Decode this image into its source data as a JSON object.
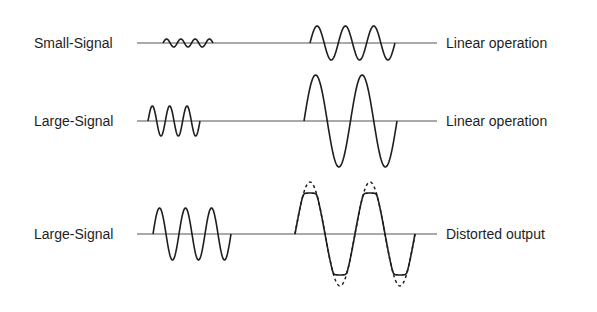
{
  "rows": [
    {
      "left_label": "Small-Signal",
      "right_label": "Linear operation",
      "baseline_y": 43,
      "input": {
        "x_start": 163,
        "x_end": 213,
        "amplitude": 4,
        "cycles": 3.5
      },
      "output": {
        "x_start": 310,
        "x_end": 395,
        "amplitude": 17,
        "cycles": 3,
        "clipped": false
      }
    },
    {
      "left_label": "Large-Signal",
      "right_label": "Linear operation",
      "baseline_y": 121,
      "input": {
        "x_start": 148,
        "x_end": 200,
        "amplitude": 15,
        "cycles": 3
      },
      "output": {
        "x_start": 304,
        "x_end": 397,
        "amplitude": 46,
        "cycles": 2,
        "clipped": false
      }
    },
    {
      "left_label": "Large-Signal",
      "right_label": "Distorted output",
      "baseline_y": 234,
      "input": {
        "x_start": 153,
        "x_end": 231,
        "amplitude": 26,
        "cycles": 3
      },
      "output": {
        "x_start": 295,
        "x_end": 415,
        "amplitude": 52,
        "clip_level": 41,
        "cycles": 2,
        "clipped": true
      }
    }
  ],
  "line": {
    "x_start": 137,
    "x_end": 437
  },
  "colors": {
    "stroke": "#1e1e1e",
    "baseline": "#555555",
    "text": "#1e1e1e"
  }
}
